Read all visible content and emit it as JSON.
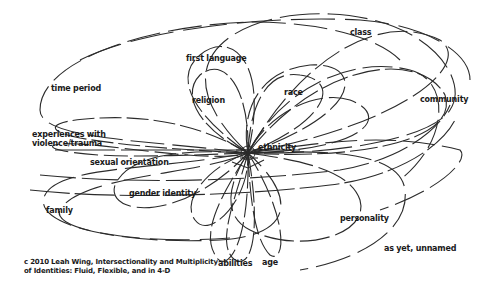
{
  "diagram": {
    "title_caption": {
      "line1": "c 2010 Leah Wing, Intersectionality and Multiplicity",
      "line2": "of Identities:  Fluid, Flexible, and in 4-D"
    },
    "center": {
      "x": 248,
      "y": 153
    },
    "stroke_color": "#2b2b2b",
    "background": "#ffffff",
    "labels": [
      {
        "id": "class",
        "text": "class",
        "x": 350,
        "y": 28
      },
      {
        "id": "first-language",
        "text": "first language",
        "x": 186,
        "y": 54
      },
      {
        "id": "time-period",
        "text": "time period",
        "x": 51,
        "y": 84
      },
      {
        "id": "religion",
        "text": "religion",
        "x": 192,
        "y": 96
      },
      {
        "id": "race",
        "text": "race",
        "x": 284,
        "y": 88
      },
      {
        "id": "community",
        "text": "community",
        "x": 420,
        "y": 95
      },
      {
        "id": "experiences",
        "text": "experiences with\nviolence/trauma",
        "x": 32,
        "y": 130
      },
      {
        "id": "ethnicity",
        "text": "ethnicity",
        "x": 258,
        "y": 143
      },
      {
        "id": "sexual-orientation",
        "text": "sexual orientation",
        "x": 90,
        "y": 158
      },
      {
        "id": "gender-identity",
        "text": "gender identity",
        "x": 129,
        "y": 189
      },
      {
        "id": "family",
        "text": "family",
        "x": 46,
        "y": 206
      },
      {
        "id": "personality",
        "text": "personality",
        "x": 340,
        "y": 214
      },
      {
        "id": "as-yet-unnamed",
        "text": "as yet, unnamed",
        "x": 384,
        "y": 244
      },
      {
        "id": "abilities",
        "text": "abilities",
        "x": 218,
        "y": 259
      },
      {
        "id": "age",
        "text": "age",
        "x": 262,
        "y": 258
      }
    ],
    "loops": [
      {
        "id": "class-loop",
        "d": "M248,153 C300,60 380,10 440,40 C470,60 420,120 248,153",
        "dash": "30 6"
      },
      {
        "id": "class-loop-outer",
        "d": "M248,153 C150,60 240,10 330,14 C430,18 470,80 450,110 C430,140 330,155 248,153",
        "dash": "40 8"
      },
      {
        "id": "community-loop",
        "d": "M248,153 C320,60 420,50 445,95 C460,140 360,160 248,153",
        "dash": "28 5"
      },
      {
        "id": "time-period-loop",
        "d": "M248,153 C150,140 40,140 40,110 C40,60 150,25 250,22 C330,22 380,40 400,60",
        "dash": "34 8"
      },
      {
        "id": "outer-top-loop",
        "d": "M80,60 C140,30 260,15 360,20 C420,24 470,50 470,80",
        "dash": "44 10"
      },
      {
        "id": "first-language-loop",
        "d": "M248,153 C200,120 170,80 200,55 C230,30 270,60 248,153",
        "dash": "26 5"
      },
      {
        "id": "religion-loop",
        "d": "M248,153 C200,130 180,95 200,75 C225,55 250,90 248,153",
        "dash": "24 4"
      },
      {
        "id": "race-loop",
        "d": "M248,153 C250,100 270,70 300,75 C340,80 330,120 248,153",
        "dash": "26 6"
      },
      {
        "id": "race-loop-2",
        "d": "M248,153 C270,110 320,90 350,100 C390,115 370,150 248,153",
        "dash": "28 6"
      },
      {
        "id": "big-arc-right",
        "d": "M248,153 C280,90 350,55 410,70 C450,80 450,140 400,180",
        "dash": "30 7"
      },
      {
        "id": "experiences-loop",
        "d": "M248,153 C180,150 120,145 80,138 C40,130 50,120 100,118 C160,115 210,130 248,153",
        "dash": "22 5"
      },
      {
        "id": "sexual-orientation-loop",
        "d": "M248,153 C190,155 100,160 60,150 C40,145 60,140 120,148 C180,155 230,160 248,153",
        "dash": "24 6"
      },
      {
        "id": "sexual-orientation-line",
        "d": "M55,150 L300,150",
        "dash": "60 6"
      },
      {
        "id": "gender-identity-loop",
        "d": "M248,153 C200,150 130,150 115,185 C105,215 180,225 248,153",
        "dash": "30 6"
      },
      {
        "id": "gender-identity-loop-2",
        "d": "M248,153 C210,165 180,200 195,220 C210,240 250,200 248,153",
        "dash": "26 5"
      },
      {
        "id": "family-loop",
        "d": "M248,153 C160,170 60,165 45,195 C30,225 120,245 220,240 C290,236 300,200 248,153",
        "dash": "36 8"
      },
      {
        "id": "family-loop-2",
        "d": "M248,153 C200,175 80,175 60,210 C50,230 140,245 230,238",
        "dash": "40 10"
      },
      {
        "id": "abilities-loop",
        "d": "M248,153 C225,190 200,230 215,255 C225,275 250,250 248,153",
        "dash": "24 5"
      },
      {
        "id": "abilities-loop-2",
        "d": "M248,153 C235,200 215,245 235,260 C255,270 260,220 248,153",
        "dash": "22 4"
      },
      {
        "id": "age-loop",
        "d": "M248,153 C250,200 255,240 270,255 C285,265 290,220 248,153",
        "dash": "24 5"
      },
      {
        "id": "personality-loop",
        "d": "M248,153 C300,160 350,170 360,200 C370,235 300,255 250,230 C220,215 230,180 248,153",
        "dash": "30 6"
      },
      {
        "id": "as-yet-unnamed-loop",
        "d": "M248,153 C320,150 400,150 405,190 C410,230 360,260 300,270",
        "dash": "36 8"
      },
      {
        "id": "long-sweep-1",
        "d": "M30,190 C120,200 250,195 330,185 C390,178 440,150 455,120",
        "dash": "40 5"
      },
      {
        "id": "long-sweep-2",
        "d": "M40,175 C140,185 260,180 340,170 C400,160 440,130 450,105",
        "dash": "36 6"
      },
      {
        "id": "right-sweep",
        "d": "M248,153 C310,145 380,130 460,150 C470,160 440,190 380,210",
        "dash": "32 7"
      },
      {
        "id": "upper-mid-loop",
        "d": "M248,153 C240,110 260,70 310,65 C360,62 370,110 248,153",
        "dash": "28 6"
      }
    ]
  }
}
